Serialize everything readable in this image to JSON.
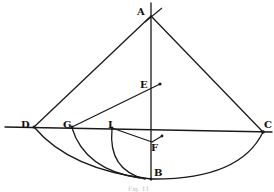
{
  "figure": {
    "caption": "Fig. 11",
    "labels": {
      "A": "A",
      "B": "B",
      "C": "C",
      "D": "D",
      "E": "E",
      "F": "F",
      "G": "G",
      "I": "I"
    },
    "colors": {
      "ink": "#1a1a1a",
      "background": "#ffffff"
    }
  }
}
